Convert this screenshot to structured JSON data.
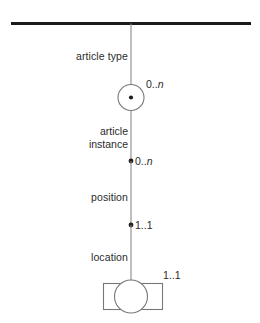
{
  "diagram": {
    "kind": "entity-relationship-chain",
    "background_color": "#ffffff",
    "line_color": "#6e6e6e",
    "thick_line_color": "#1a1a1a",
    "text_color": "#2b2b2b",
    "top_bar": {
      "name": "root-boundary-line"
    },
    "nodes": [
      {
        "id": "article-type-relation",
        "shape": "circle-with-center-dot",
        "role_label": "article type",
        "cardinality": "0..n",
        "cardinality_prefix": "0..",
        "cardinality_suffix": "n"
      },
      {
        "id": "article-instance-relation",
        "shape": "filled-dot",
        "role_label": "article\ninstance",
        "role_label_line1": "article",
        "role_label_line2": "instance",
        "cardinality": "0..n",
        "cardinality_prefix": "0..",
        "cardinality_suffix": "n"
      },
      {
        "id": "position-relation",
        "shape": "filled-dot",
        "role_label": "position",
        "cardinality": "1..1",
        "cardinality_prefix": "1..",
        "cardinality_suffix": "1"
      },
      {
        "id": "location-relation",
        "shape": "rectangle-with-circle",
        "role_label": "location",
        "cardinality": "1..1",
        "cardinality_prefix": "1..",
        "cardinality_suffix": "1"
      }
    ],
    "labels": {
      "article_type": "article type",
      "article_instance_line1": "article",
      "article_instance_line2": "instance",
      "position": "position",
      "location": "location",
      "card_0n_prefix": "0..",
      "card_0n_suffix": "n",
      "card_11_prefix": "1..",
      "card_11_suffix": "1"
    }
  }
}
